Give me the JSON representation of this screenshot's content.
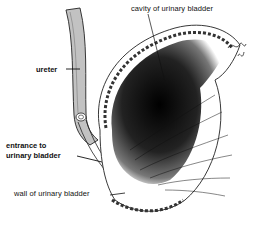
{
  "diagram": {
    "labels": {
      "cavity": "cavity of urinary bladder",
      "ureter": "ureter",
      "entrance_line1": "entrance to",
      "entrance_line2": "urinary bladder",
      "wall": "wall of urinary bladder"
    },
    "colors": {
      "ink": "#111111",
      "background": "#ffffff",
      "shading": "#1a1a1a"
    }
  }
}
